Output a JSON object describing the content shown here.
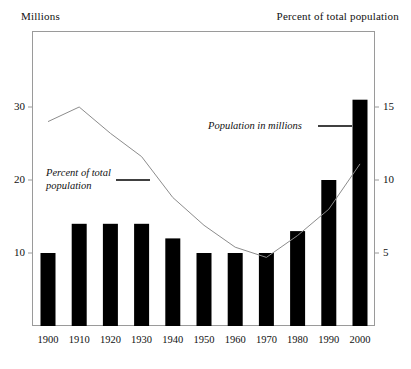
{
  "axis_captions": {
    "left": "Millions",
    "right": "Percent of total population"
  },
  "annotations": {
    "percent_line1": "Percent of total",
    "percent_line2": "population",
    "millions": "Population in millions"
  },
  "colors": {
    "bar": "#000000",
    "line": "#8c8c8c",
    "frame": "#9a9a9a",
    "text": "#111111",
    "background": "#ffffff"
  },
  "chart_data": {
    "type": "bar",
    "title": "",
    "subtitle": "",
    "xlabel": "",
    "ylabel": "Millions",
    "y2label": "Percent of total population",
    "categories": [
      "1900",
      "1910",
      "1920",
      "1930",
      "1940",
      "1950",
      "1960",
      "1970",
      "1980",
      "1990",
      "2000"
    ],
    "ylim": [
      0,
      37
    ],
    "y2lim": [
      0,
      18.5
    ],
    "yticks": [
      10,
      20,
      30
    ],
    "y2ticks": [
      5,
      10,
      15
    ],
    "grid": false,
    "legend_position": "inside",
    "series": [
      {
        "name": "Population in millions",
        "type": "bar",
        "axis": "left",
        "values": [
          10,
          14,
          14,
          14,
          12,
          10,
          10,
          10,
          13,
          20,
          31
        ]
      },
      {
        "name": "Percent of total population",
        "type": "line",
        "axis": "right",
        "values": [
          14.0,
          15.0,
          13.2,
          11.6,
          8.8,
          6.9,
          5.4,
          4.7,
          6.2,
          8.0,
          11.1
        ]
      }
    ]
  }
}
